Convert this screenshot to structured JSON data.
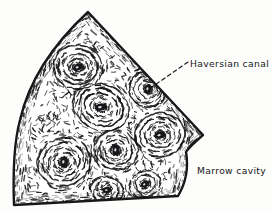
{
  "figure": {
    "style": "ink line drawing",
    "background_color": "#fdfdfb",
    "ink_color": "#17171a"
  },
  "labels": {
    "haversian": "Haversian canal",
    "marrow": "Marrow cavity"
  },
  "leader_line": {
    "name": "haversian-leader-line",
    "style": "dashed",
    "from_x": 188,
    "from_y": 62,
    "to_x": 149,
    "to_y": 89
  },
  "specimen": {
    "name": "bone-wedge",
    "outline_points": [
      [
        88,
        12
      ],
      [
        203,
        135
      ],
      [
        186,
        152
      ],
      [
        178,
        196
      ],
      [
        14,
        205
      ],
      [
        20,
        120
      ],
      [
        45,
        55
      ]
    ],
    "border_width": 2.4,
    "marrow_border_note": "concave lower-right boundary facing marrow cavity"
  },
  "osteons": [
    {
      "name": "osteon-1",
      "cx": 78,
      "cy": 67,
      "rings": 5,
      "rx": 26,
      "ry": 23,
      "canal_rx": 5.0,
      "canal_ry": 3.4,
      "canal_rot": -20
    },
    {
      "name": "osteon-2",
      "cx": 101,
      "cy": 107,
      "rings": 5,
      "rx": 30,
      "ry": 24,
      "canal_rx": 6.0,
      "canal_ry": 3.6,
      "canal_rot": -8
    },
    {
      "name": "osteon-3",
      "cx": 148,
      "cy": 89,
      "rings": 4,
      "rx": 20,
      "ry": 19,
      "canal_rx": 3.4,
      "canal_ry": 5.2,
      "canal_rot": 15
    },
    {
      "name": "osteon-4",
      "cx": 160,
      "cy": 135,
      "rings": 5,
      "rx": 26,
      "ry": 23,
      "canal_rx": 5.6,
      "canal_ry": 3.6,
      "canal_rot": -12
    },
    {
      "name": "osteon-5",
      "cx": 116,
      "cy": 150,
      "rings": 4,
      "rx": 23,
      "ry": 21,
      "canal_rx": 3.6,
      "canal_ry": 5.4,
      "canal_rot": 8
    },
    {
      "name": "osteon-6",
      "cx": 64,
      "cy": 162,
      "rings": 5,
      "rx": 28,
      "ry": 25,
      "canal_rx": 4.0,
      "canal_ry": 5.6,
      "canal_rot": 10
    },
    {
      "name": "osteon-7",
      "cx": 107,
      "cy": 190,
      "rings": 3,
      "rx": 18,
      "ry": 14,
      "canal_rx": 4.2,
      "canal_ry": 3.0,
      "canal_rot": -5
    },
    {
      "name": "osteon-8",
      "cx": 145,
      "cy": 184,
      "rings": 3,
      "rx": 17,
      "ry": 14,
      "canal_rx": 4.4,
      "canal_ry": 3.0,
      "canal_rot": -25
    }
  ],
  "texture": {
    "name": "interstitial-hatching",
    "stroke_count": 900,
    "description": "short irregular ink strokes filling interstitial lamellae"
  }
}
